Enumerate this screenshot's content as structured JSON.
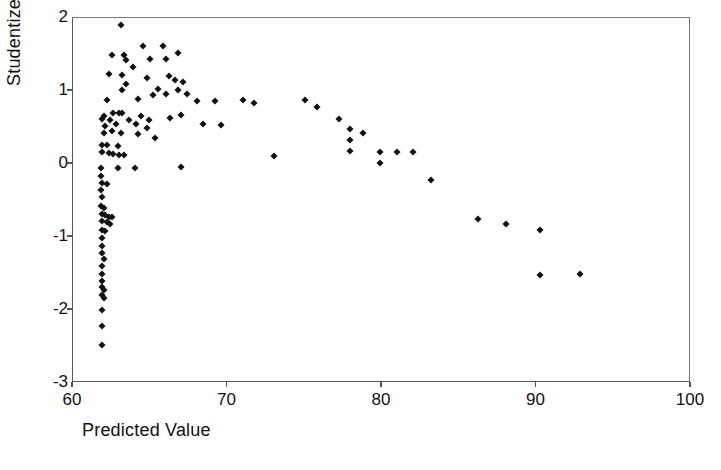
{
  "chart_data": {
    "type": "scatter",
    "title": "",
    "xlabel": "Predicted Value",
    "ylabel": "Studentized Residual",
    "xlim": [
      60,
      100
    ],
    "ylim": [
      -3,
      2
    ],
    "xticks": [
      60,
      70,
      80,
      90,
      100
    ],
    "yticks": [
      2,
      1,
      0,
      -1,
      -2,
      -3
    ],
    "xtick_labels": [
      "60",
      "70",
      "80",
      "90",
      "100"
    ],
    "ytick_labels": [
      "2",
      "1",
      "0",
      "-1",
      "-2",
      "-3"
    ],
    "grid": false,
    "legend": null,
    "marker": "diamond",
    "marker_color": "#111111",
    "series": [
      {
        "name": "residuals",
        "points": [
          [
            63.1,
            1.9
          ],
          [
            64.5,
            1.62
          ],
          [
            65.8,
            1.62
          ],
          [
            62.5,
            1.5
          ],
          [
            63.3,
            1.5
          ],
          [
            66.8,
            1.52
          ],
          [
            63.4,
            1.42
          ],
          [
            65.0,
            1.44
          ],
          [
            66.0,
            1.44
          ],
          [
            63.9,
            1.33
          ],
          [
            62.3,
            1.23
          ],
          [
            63.2,
            1.22
          ],
          [
            64.8,
            1.18
          ],
          [
            66.2,
            1.2
          ],
          [
            67.1,
            1.13
          ],
          [
            63.4,
            1.09
          ],
          [
            66.6,
            1.15
          ],
          [
            63.2,
            1.01
          ],
          [
            65.5,
            1.03
          ],
          [
            66.8,
            1.02
          ],
          [
            62.2,
            0.88
          ],
          [
            65.2,
            0.95
          ],
          [
            66.0,
            0.96
          ],
          [
            67.4,
            0.96
          ],
          [
            64.2,
            0.89
          ],
          [
            68.0,
            0.86
          ],
          [
            69.2,
            0.86
          ],
          [
            71.0,
            0.88
          ],
          [
            71.7,
            0.83
          ],
          [
            62.0,
            0.66
          ],
          [
            62.6,
            0.7
          ],
          [
            63.0,
            0.7
          ],
          [
            63.2,
            0.7
          ],
          [
            61.9,
            0.62
          ],
          [
            62.4,
            0.6
          ],
          [
            63.6,
            0.6
          ],
          [
            64.4,
            0.66
          ],
          [
            64.9,
            0.6
          ],
          [
            66.3,
            0.63
          ],
          [
            67.0,
            0.67
          ],
          [
            62.1,
            0.52
          ],
          [
            62.8,
            0.55
          ],
          [
            64.1,
            0.55
          ],
          [
            64.8,
            0.5
          ],
          [
            68.4,
            0.55
          ],
          [
            69.6,
            0.53
          ],
          [
            62.0,
            0.43
          ],
          [
            62.5,
            0.45
          ],
          [
            63.1,
            0.42
          ],
          [
            64.2,
            0.41
          ],
          [
            65.3,
            0.36
          ],
          [
            61.9,
            0.26
          ],
          [
            62.2,
            0.26
          ],
          [
            62.9,
            0.24
          ],
          [
            61.9,
            0.17
          ],
          [
            62.3,
            0.15
          ],
          [
            62.6,
            0.14
          ],
          [
            63.0,
            0.12
          ],
          [
            63.3,
            0.12
          ],
          [
            73.0,
            0.11
          ],
          [
            61.8,
            -0.05
          ],
          [
            62.9,
            -0.05
          ],
          [
            64.0,
            -0.05
          ],
          [
            67.0,
            -0.04
          ],
          [
            61.8,
            -0.17
          ],
          [
            61.9,
            -0.26
          ],
          [
            62.2,
            -0.28
          ],
          [
            61.8,
            -0.36
          ],
          [
            61.9,
            -0.45
          ],
          [
            61.8,
            -0.58
          ],
          [
            62.0,
            -0.6
          ],
          [
            61.9,
            -0.68
          ],
          [
            62.1,
            -0.7
          ],
          [
            62.3,
            -0.72
          ],
          [
            62.5,
            -0.73
          ],
          [
            61.9,
            -0.78
          ],
          [
            62.2,
            -0.8
          ],
          [
            62.4,
            -0.82
          ],
          [
            61.9,
            -0.9
          ],
          [
            62.1,
            -0.92
          ],
          [
            61.9,
            -1.02
          ],
          [
            61.9,
            -1.12
          ],
          [
            61.9,
            -1.22
          ],
          [
            62.0,
            -1.3
          ],
          [
            61.9,
            -1.4
          ],
          [
            61.9,
            -1.5
          ],
          [
            61.9,
            -1.6
          ],
          [
            61.9,
            -1.68
          ],
          [
            62.0,
            -1.72
          ],
          [
            61.9,
            -1.8
          ],
          [
            62.0,
            -1.84
          ],
          [
            61.9,
            -2.0
          ],
          [
            61.9,
            -2.22
          ],
          [
            61.9,
            -2.48
          ],
          [
            75.0,
            0.88
          ],
          [
            75.8,
            0.78
          ],
          [
            77.2,
            0.62
          ],
          [
            77.9,
            0.48
          ],
          [
            77.9,
            0.33
          ],
          [
            77.9,
            0.18
          ],
          [
            78.8,
            0.43
          ],
          [
            79.9,
            0.17
          ],
          [
            79.9,
            0.02
          ],
          [
            81.0,
            0.16
          ],
          [
            82.0,
            0.16
          ],
          [
            83.2,
            -0.22
          ],
          [
            86.2,
            -0.75
          ],
          [
            88.0,
            -0.82
          ],
          [
            90.2,
            -0.9
          ],
          [
            90.2,
            -1.52
          ],
          [
            92.8,
            -1.5
          ]
        ]
      }
    ]
  },
  "axes": {
    "x_title": "Predicted Value",
    "y_title": "Studentized Residual"
  }
}
